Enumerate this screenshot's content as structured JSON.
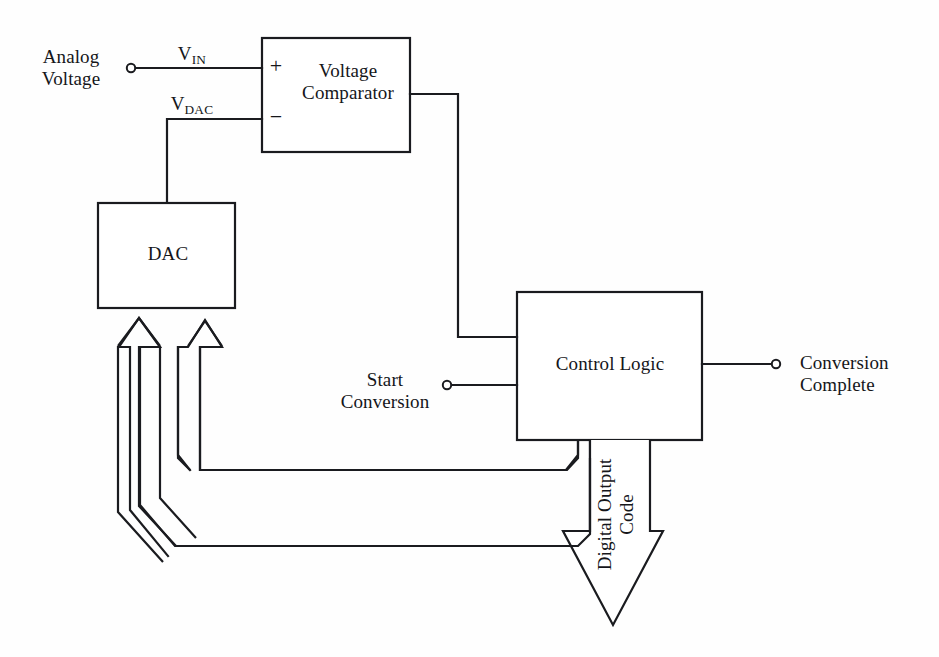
{
  "diagram": {
    "stroke_color": "#1a1b1f",
    "background_color": "#fefefe",
    "blocks": [
      {
        "id": "voltage_comparator",
        "label_line1": "Voltage",
        "label_line2": "Comparator"
      },
      {
        "id": "dac",
        "label": "DAC"
      },
      {
        "id": "control_logic",
        "label": "Control Logic"
      }
    ],
    "signals": {
      "analog_voltage_line1": "Analog",
      "analog_voltage_line2": "Voltage",
      "vin_base": "V",
      "vin_sub": "IN",
      "vdac_base": "V",
      "vdac_sub": "DAC",
      "comparator_plus": "+",
      "comparator_minus": "−",
      "start_conversion_line1": "Start",
      "start_conversion_line2": "Conversion",
      "conversion_complete_line1": "Conversion",
      "conversion_complete_line2": "Complete",
      "digital_output_code_line1": "Digital Output",
      "digital_output_code_line2": "Code"
    }
  }
}
